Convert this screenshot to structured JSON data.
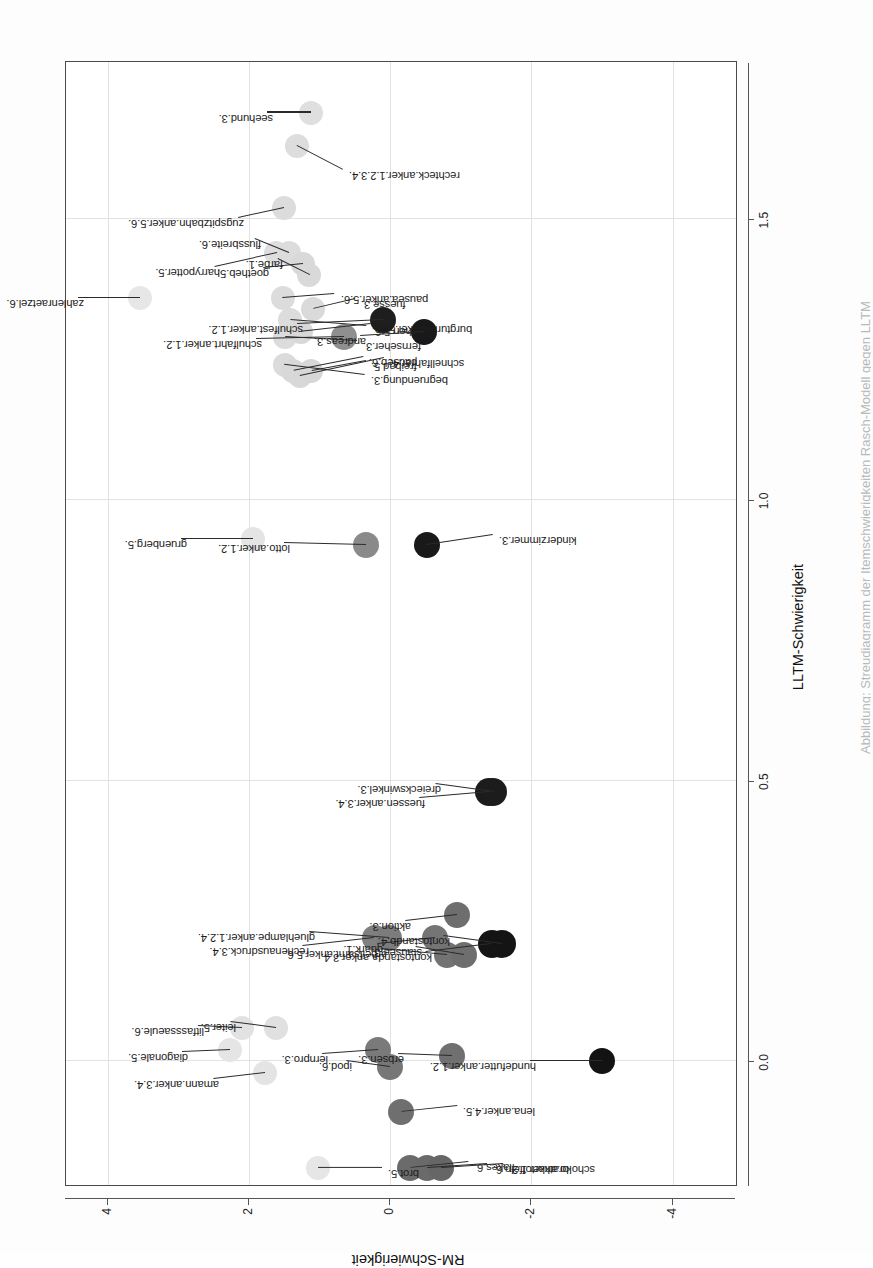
{
  "figure": {
    "type": "scatter",
    "xlabel": "LLTM-Schwierigkeit",
    "ylabel": "RM-Schwierigkeit",
    "caption": "Abbildung: Streudiagramm der Itemschwierigkeiten Rasch-Modell gegen LLTM",
    "rotation": "page rotated 90 degrees"
  },
  "axes": {
    "x": {
      "ticks": [
        "0.0",
        "0.5",
        "1.0",
        "1.5"
      ],
      "values": [
        0.0,
        0.5,
        1.0,
        1.5
      ],
      "min": -0.22,
      "max": 1.78
    },
    "y": {
      "ticks": [
        "4",
        "2",
        "0",
        "-2",
        "-4"
      ],
      "values": [
        4,
        2,
        0,
        -2,
        -4
      ],
      "min": -4.9,
      "max": 4.6
    }
  },
  "chart_data": {
    "type": "scatter",
    "title": "",
    "xlabel": "LLTM-Schwierigkeit",
    "ylabel": "RM-Schwierigkeit",
    "xlim": [
      -0.22,
      1.78
    ],
    "ylim": [
      -4.9,
      4.6
    ],
    "grid": true,
    "legend": "none",
    "encoding": "point fill darkness encodes RM-Schwierigkeit (light = high RM difficulty, dark = low)",
    "points": [
      {
        "label": "zahlenraetzel.6.",
        "x": 1.36,
        "y": 3.55,
        "shade": "#e7e7e7",
        "r": 12
      },
      {
        "label": "gruenberg.5.",
        "x": 0.93,
        "y": 1.95,
        "shade": "#e4e4e4",
        "r": 12
      },
      {
        "label": "harrypotter.5.",
        "x": 1.44,
        "y": 1.62,
        "shade": "#dedede",
        "r": 12
      },
      {
        "label": "pausea.anker.5.6.",
        "x": 1.36,
        "y": 1.53,
        "shade": "#dcdcdc",
        "r": 12
      },
      {
        "label": "zugspitzbahn.anker.5.6.",
        "x": 1.52,
        "y": 1.51,
        "shade": "#dcdcdc",
        "r": 12
      },
      {
        "label": "flussbreite.6.",
        "x": 1.44,
        "y": 1.44,
        "shade": "#dcdcdc",
        "r": 12
      },
      {
        "label": "rechteck.anker.1.2.3.4.",
        "x": 1.63,
        "y": 1.32,
        "shade": "#dddddd",
        "r": 12
      },
      {
        "label": "goetheb.5.",
        "x": 1.42,
        "y": 1.24,
        "shade": "#d9d9d9",
        "r": 12
      },
      {
        "label": "farbe.1.",
        "x": 1.4,
        "y": 1.15,
        "shade": "#d9d9d9",
        "r": 12
      },
      {
        "label": "seehund.3.",
        "x": 1.69,
        "y": 1.12,
        "shade": "#dfdfdf",
        "r": 12
      },
      {
        "label": "fuesse.3.",
        "x": 1.34,
        "y": 1.1,
        "shade": "#dadada",
        "r": 12
      },
      {
        "label": "darlehen.5.6.",
        "x": 1.32,
        "y": 1.42,
        "shade": "#dcdcdc",
        "r": 12
      },
      {
        "label": "fernseher.3.",
        "x": 1.29,
        "y": 1.49,
        "shade": "#dcdcdc",
        "r": 12
      },
      {
        "label": "begruendung.3.",
        "x": 1.24,
        "y": 1.5,
        "shade": "#dbdbdb",
        "r": 12
      },
      {
        "label": "pauseb.6.",
        "x": 1.23,
        "y": 1.38,
        "shade": "#d8d8d8",
        "r": 12
      },
      {
        "label": "schnellfahrer.4.",
        "x": 1.22,
        "y": 1.28,
        "shade": "#d8d8d8",
        "r": 12
      },
      {
        "label": "burgturm.anker.5.6.",
        "x": 1.3,
        "y": 1.27,
        "shade": "#d8d8d8",
        "r": 12
      },
      {
        "label": "freibad.5.",
        "x": 1.23,
        "y": 1.12,
        "shade": "#d7d7d7",
        "r": 12
      },
      {
        "label": "schulfahrt.anker.1.2.",
        "x": 1.29,
        "y": 0.66,
        "shade": "#8f8f8f",
        "r": 13
      },
      {
        "label": "lotto.anker.1.2.",
        "x": 0.92,
        "y": 0.35,
        "shade": "#8a8a8a",
        "r": 13
      },
      {
        "label": "schulfest.anker.1.2.",
        "x": 1.32,
        "y": 0.1,
        "shade": "#1e1e1e",
        "r": 13
      },
      {
        "label": "andreas.3.",
        "x": 1.3,
        "y": -0.48,
        "shade": "#191919",
        "r": 13
      },
      {
        "label": "kinderzimmer.3.",
        "x": 0.92,
        "y": -0.52,
        "shade": "#191919",
        "r": 13
      },
      {
        "label": "diagonale.5.",
        "x": 0.02,
        "y": 2.28,
        "shade": "#e5e5e5",
        "r": 12
      },
      {
        "label": "litfasssaeule.6.",
        "x": 0.06,
        "y": 2.1,
        "shade": "#e2e2e2",
        "r": 12
      },
      {
        "label": "amann.anker.3.4.",
        "x": -0.02,
        "y": 1.78,
        "shade": "#e4e4e4",
        "r": 12
      },
      {
        "label": "leiter.5.",
        "x": 0.06,
        "y": 1.62,
        "shade": "#e0e0e0",
        "r": 12
      },
      {
        "label": "brot.5.",
        "x": -0.19,
        "y": 1.02,
        "shade": "#e6e6e6",
        "r": 12
      },
      {
        "label": "rechenausdruck.3.4.",
        "x": 0.22,
        "y": 0.22,
        "shade": "#808080",
        "r": 13
      },
      {
        "label": "gluehlampe.anker.1.2.4.",
        "x": 0.22,
        "y": 0.02,
        "shade": "#7c7c7c",
        "r": 13
      },
      {
        "label": "lernpro.3.",
        "x": 0.02,
        "y": 0.18,
        "shade": "#7a7a7a",
        "r": 13
      },
      {
        "label": "ipod.6.",
        "x": -0.01,
        "y": 0.0,
        "shade": "#777777",
        "r": 13
      },
      {
        "label": "lena.anker.4.5.",
        "x": -0.09,
        "y": -0.15,
        "shade": "#6f6f6f",
        "r": 13
      },
      {
        "label": "flakes.6.",
        "x": -0.19,
        "y": -0.28,
        "shade": "#6b6b6b",
        "r": 13
      },
      {
        "label": "bratkartoffeln.6.",
        "x": -0.19,
        "y": -0.52,
        "shade": "#6a6a6a",
        "r": 13
      },
      {
        "label": "schoko.anker.1.2.",
        "x": -0.19,
        "y": -0.72,
        "shade": "#666666",
        "r": 13
      },
      {
        "label": "erbsen.3.",
        "x": 0.01,
        "y": -0.88,
        "shade": "#707070",
        "r": 13
      },
      {
        "label": "quark.1.",
        "x": 0.22,
        "y": -0.63,
        "shade": "#757575",
        "r": 13
      },
      {
        "label": "arbeitsamt.anker.5.6.",
        "x": 0.19,
        "y": -0.8,
        "shade": "#737373",
        "r": 13
      },
      {
        "label": "aktion.3.",
        "x": 0.26,
        "y": -0.95,
        "shade": "#6e6e6e",
        "r": 13
      },
      {
        "label": "stausee.3.",
        "x": 0.19,
        "y": -1.04,
        "shade": "#6e6e6e",
        "r": 13
      },
      {
        "label": "fuessen.anker.3.4.",
        "x": 0.48,
        "y": -1.4,
        "shade": "#1c1c1c",
        "r": 14
      },
      {
        "label": "dreieckswinkel.3.",
        "x": 0.48,
        "y": -1.46,
        "shade": "#1c1c1c",
        "r": 14
      },
      {
        "label": "kontostanda.anker.3.4.",
        "x": 0.21,
        "y": -1.44,
        "shade": "#141414",
        "r": 14
      },
      {
        "label": "kontostandb.4.",
        "x": 0.21,
        "y": -1.58,
        "shade": "#141414",
        "r": 14
      },
      {
        "label": "hundefutter.anker.1.2.",
        "x": 0.0,
        "y": -3.0,
        "shade": "#131313",
        "r": 13
      }
    ],
    "label_offsets": {
      "zahlenraetzel.6.": {
        "dx": 0,
        "dy": -62
      },
      "gruenberg.5.": {
        "dx": 0,
        "dy": -72
      },
      "harrypotter.5.": {
        "dx": -14,
        "dy": -62
      },
      "pausea.anker.5.6.": {
        "dx": 4,
        "dy": 52
      },
      "zugspitzbahn.anker.5.6.": {
        "dx": -10,
        "dy": -46
      },
      "flussbreite.6.": {
        "dx": 14,
        "dy": -34
      },
      "rechteck.anker.1.2.3.4.": {
        "dx": -24,
        "dy": 46
      },
      "goetheb.5.": {
        "dx": -4,
        "dy": -40
      },
      "farbe.1.": {
        "dx": 16,
        "dy": -32
      },
      "seehund.3.": {
        "dx": 0,
        "dy": -44
      },
      "fuesse.3.": {
        "dx": 10,
        "dy": 42
      },
      "darlehen.5.6.": {
        "dx": -6,
        "dy": 76
      },
      "fernseher.3.": {
        "dx": -4,
        "dy": 72
      },
      "begruendung.3.": {
        "dx": -10,
        "dy": 80
      },
      "pauseb.6.": {
        "dx": 14,
        "dy": 70
      },
      "schnellfahrer.4.": {
        "dx": 18,
        "dy": 84
      },
      "burgturm.anker.5.6.": {
        "dx": 8,
        "dy": 70
      },
      "freibad.5.": {
        "dx": 10,
        "dy": 54
      },
      "schulfahrt.anker.1.2.": {
        "dx": -2,
        "dy": -88
      },
      "lotto.anker.1.2.": {
        "dx": 2,
        "dy": -82
      },
      "schulfest.anker.1.2.": {
        "dx": -4,
        "dy": -86
      },
      "andreas.3.": {
        "dx": -4,
        "dy": -64
      },
      "kinderzimmer.3.": {
        "dx": 10,
        "dy": 66
      },
      "diagonale.5.": {
        "dx": -2,
        "dy": -48
      },
      "litfasssaeule.6.": {
        "dx": 2,
        "dy": -44
      },
      "amann.anker.3.4.": {
        "dx": -6,
        "dy": -52
      },
      "leiter.5.": {
        "dx": 6,
        "dy": -46
      },
      "brot.5.": {
        "dx": 0,
        "dy": 64
      },
      "rechenausdruck.3.4.": {
        "dx": -8,
        "dy": -72
      },
      "gluehlampe.anker.1.2.4.": {
        "dx": 6,
        "dy": -80
      },
      "lernpro.3.": {
        "dx": -4,
        "dy": -56
      },
      "ipod.6.": {
        "dx": 6,
        "dy": -44
      },
      "lena.anker.4.5.": {
        "dx": 6,
        "dy": 56
      },
      "flakes.6.": {
        "dx": 6,
        "dy": 58
      },
      "bratkartoffeln.6.": {
        "dx": 4,
        "dy": 60
      },
      "schoko.anker.1.2.": {
        "dx": 4,
        "dy": 62
      },
      "erbsen.3.": {
        "dx": 2,
        "dy": -54
      },
      "quark.1.": {
        "dx": -6,
        "dy": -58
      },
      "arbeitsamt.anker.5.6.": {
        "dx": 6,
        "dy": -66
      },
      "aktion.3.": {
        "dx": -6,
        "dy": -52
      },
      "stausee.3.": {
        "dx": 8,
        "dy": -48
      },
      "fuessen.anker.3.4.": {
        "dx": -6,
        "dy": -70
      },
      "dreieckswinkel.3.": {
        "dx": 8,
        "dy": -58
      },
      "kontostanda.anker.3.4.": {
        "dx": -8,
        "dy": -66
      },
      "kontostandb.4.": {
        "dx": 8,
        "dy": -58
      },
      "hundefutter.anker.1.2.": {
        "dx": 0,
        "dy": -72
      }
    }
  }
}
